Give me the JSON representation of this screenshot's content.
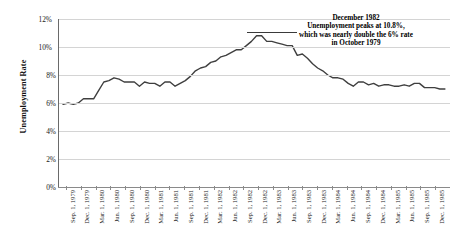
{
  "axes": {
    "y_title": "Unemployment Rate",
    "y_ticks": [
      "0%",
      "2%",
      "4%",
      "6%",
      "8%",
      "10%",
      "12%"
    ],
    "x_ticks": [
      "Sep. 1, 1979",
      "Dec. 1, 1979",
      "Mar. 1, 1980",
      "Jun. 1, 1980",
      "Sep. 1, 1980",
      "Dec. 1, 1980",
      "Mar. 1, 1981",
      "Jun. 1, 1981",
      "Sep. 1, 1981",
      "Dec. 1, 1981",
      "Mar. 1, 1982",
      "Jun. 1, 1982",
      "Sep. 1, 1982",
      "Dec. 1, 1982",
      "Mar. 1, 1983",
      "Jun. 1, 1983",
      "Sep. 1, 1983",
      "Dec. 1, 1983",
      "Mar. 1, 1984",
      "Jun. 1, 1984",
      "Sep. 1, 1984",
      "Dec. 1, 1984",
      "Mar. 1, 1985",
      "Jun. 1, 1985",
      "Sep. 1, 1985",
      "Dec. 1, 1985"
    ]
  },
  "annotation": {
    "line1": "December 1982",
    "line2": "Unemployment peaks at 10.8%,",
    "line3": "which was nearly double the 6% rate",
    "line4": "in October 1979"
  },
  "colors": {
    "series": "#3f3f3f",
    "grid": "#d4d4d4",
    "axis": "#6a6a6a",
    "text": "#1a1a1a",
    "background": "#ffffff"
  },
  "chart_data": {
    "type": "line",
    "title": "",
    "xlabel": "",
    "ylabel": "Unemployment Rate",
    "ylim": [
      0,
      12
    ],
    "grid": true,
    "legend": "none",
    "x_unit": "month",
    "x_start": "1979-09",
    "x_end": "1985-12",
    "x": [
      "Sep 1979",
      "Oct 1979",
      "Nov 1979",
      "Dec 1979",
      "Jan 1980",
      "Feb 1980",
      "Mar 1980",
      "Apr 1980",
      "May 1980",
      "Jun 1980",
      "Jul 1980",
      "Aug 1980",
      "Sep 1980",
      "Oct 1980",
      "Nov 1980",
      "Dec 1980",
      "Jan 1981",
      "Feb 1981",
      "Mar 1981",
      "Apr 1981",
      "May 1981",
      "Jun 1981",
      "Jul 1981",
      "Aug 1981",
      "Sep 1981",
      "Oct 1981",
      "Nov 1981",
      "Dec 1981",
      "Jan 1982",
      "Feb 1982",
      "Mar 1982",
      "Apr 1982",
      "May 1982",
      "Jun 1982",
      "Jul 1982",
      "Aug 1982",
      "Sep 1982",
      "Oct 1982",
      "Nov 1982",
      "Dec 1982",
      "Jan 1983",
      "Feb 1983",
      "Mar 1983",
      "Apr 1983",
      "May 1983",
      "Jun 1983",
      "Jul 1983",
      "Aug 1983",
      "Sep 1983",
      "Oct 1983",
      "Nov 1983",
      "Dec 1983",
      "Jan 1984",
      "Feb 1984",
      "Mar 1984",
      "Apr 1984",
      "May 1984",
      "Jun 1984",
      "Jul 1984",
      "Aug 1984",
      "Sep 1984",
      "Oct 1984",
      "Nov 1984",
      "Dec 1984",
      "Jan 1985",
      "Feb 1985",
      "Mar 1985",
      "Apr 1985",
      "May 1985",
      "Jun 1985",
      "Jul 1985",
      "Aug 1985",
      "Sep 1985",
      "Oct 1985",
      "Nov 1985",
      "Dec 1985"
    ],
    "values": [
      5.9,
      6.0,
      5.9,
      6.0,
      6.3,
      6.3,
      6.3,
      6.9,
      7.5,
      7.6,
      7.8,
      7.7,
      7.5,
      7.5,
      7.5,
      7.2,
      7.5,
      7.4,
      7.4,
      7.2,
      7.5,
      7.5,
      7.2,
      7.4,
      7.6,
      7.9,
      8.3,
      8.5,
      8.6,
      8.9,
      9.0,
      9.3,
      9.4,
      9.6,
      9.8,
      9.8,
      10.1,
      10.4,
      10.8,
      10.8,
      10.4,
      10.4,
      10.3,
      10.2,
      10.1,
      10.1,
      9.4,
      9.5,
      9.2,
      8.8,
      8.5,
      8.3,
      8.0,
      7.8,
      7.8,
      7.7,
      7.4,
      7.2,
      7.5,
      7.5,
      7.3,
      7.4,
      7.2,
      7.3,
      7.3,
      7.2,
      7.2,
      7.3,
      7.2,
      7.4,
      7.4,
      7.1,
      7.1,
      7.1,
      7.0,
      7.0
    ]
  }
}
